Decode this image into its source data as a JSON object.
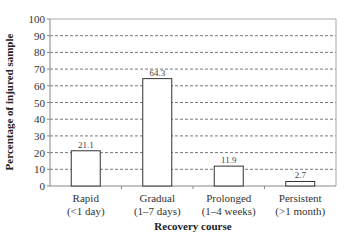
{
  "chart_data": {
    "type": "bar",
    "title": "",
    "xlabel": "Recovery course",
    "ylabel": "Percentage of injured sample",
    "categories": [
      "Rapid\n(<1 day)",
      "Gradual\n(1–7 days)",
      "Prolonged\n(1–4 weeks)",
      "Persistent\n(>1 month)"
    ],
    "category_lines": [
      [
        "Rapid",
        "(<1 day)"
      ],
      [
        "Gradual",
        "(1–7 days)"
      ],
      [
        "Prolonged",
        "(1–4 weeks)"
      ],
      [
        "Persistent",
        "(>1 month)"
      ]
    ],
    "values": [
      21.1,
      64.3,
      11.9,
      2.7
    ],
    "data_labels": [
      "21.1",
      "64.3",
      "11.9",
      "2.7"
    ],
    "ylim": [
      0,
      100
    ],
    "yticks": [
      0,
      10,
      20,
      30,
      40,
      50,
      60,
      70,
      80,
      90,
      100
    ],
    "grid": "dashed horizontal",
    "legend": "none",
    "colors": {
      "bar_fill": "#ffffff",
      "bar_stroke": "#333333",
      "grid": "#555555",
      "axis": "#888888"
    }
  }
}
